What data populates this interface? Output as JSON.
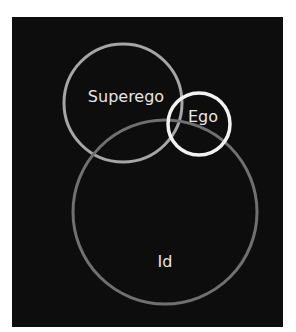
{
  "diagram": {
    "type": "overlapping-circles",
    "background": "#0d0d0d",
    "circles": [
      {
        "id": "superego",
        "label": "Superego",
        "cx": 123,
        "cy": 103,
        "r": 59,
        "stroke": "#a6a6a6"
      },
      {
        "id": "id",
        "label": "Id",
        "cx": 165,
        "cy": 212,
        "r": 92,
        "stroke": "#707070"
      },
      {
        "id": "ego",
        "label": "Ego",
        "cx": 199,
        "cy": 124,
        "r": 31,
        "stroke": "#f2f2f2"
      }
    ],
    "labels": {
      "superego": "Superego",
      "ego": "Ego",
      "id": "Id"
    }
  }
}
